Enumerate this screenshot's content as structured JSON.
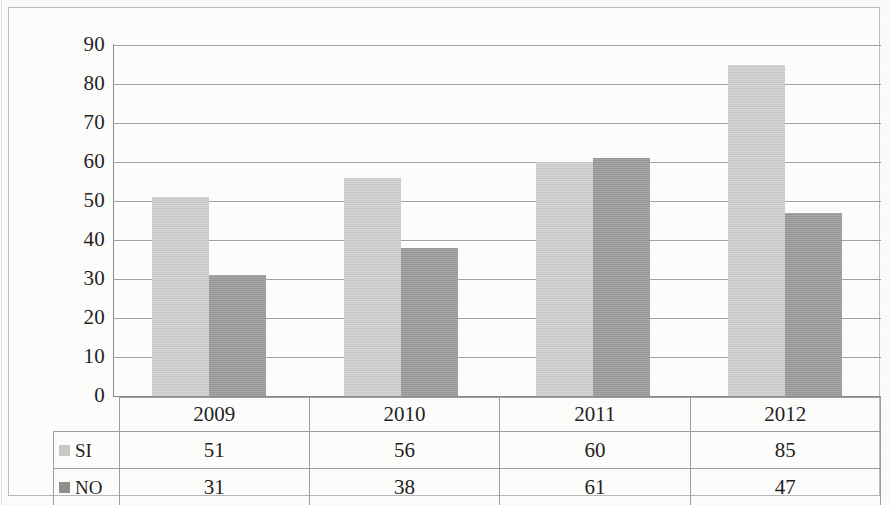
{
  "chart_data": {
    "type": "bar",
    "title": "",
    "subtitle": "",
    "xlabel": "",
    "ylabel": "",
    "categories": [
      "2009",
      "2010",
      "2011",
      "2012"
    ],
    "series": [
      {
        "name": "SI",
        "values": [
          51,
          56,
          60,
          85
        ],
        "color": "#cfcfcf"
      },
      {
        "name": "NO",
        "values": [
          31,
          38,
          61,
          47
        ],
        "color": "#9d9d9d"
      }
    ],
    "ylim": [
      0,
      90
    ],
    "y_ticks": [
      "90",
      "80",
      "70",
      "60",
      "50",
      "40",
      "30",
      "20",
      "10",
      "0"
    ],
    "y_tick_values": [
      90,
      80,
      70,
      60,
      50,
      40,
      30,
      20,
      10,
      0
    ],
    "y_tick_step": 10,
    "grid": true,
    "grid_axis": "y",
    "legend": "data-table",
    "legend_position": "below"
  },
  "table": {
    "years_row": [
      "2009",
      "2010",
      "2011",
      "2012"
    ],
    "rows": [
      {
        "label": "SI",
        "swatch": "si",
        "values": [
          "51",
          "56",
          "60",
          "85"
        ]
      },
      {
        "label": "NO",
        "swatch": "no",
        "values": [
          "31",
          "38",
          "61",
          "47"
        ]
      }
    ]
  },
  "axis": {
    "ticks": [
      "90",
      "80",
      "70",
      "60",
      "50",
      "40",
      "30",
      "20",
      "10",
      "0"
    ]
  },
  "colors": {
    "series_si": "#cfcfcf",
    "series_no": "#9d9d9d",
    "gridline": "#a2a2a2",
    "frame": "#b9b9b9",
    "text": "#1f1f1f",
    "background": "#fdfdfc"
  }
}
